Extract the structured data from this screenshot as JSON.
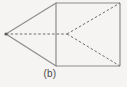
{
  "figure": {
    "caption": "(b)",
    "kind": "geometric-line-diagram",
    "background_color": "#f5f4f2",
    "solid_line_color": "#8b8b8b",
    "dashed_line_color": "#6f6f6f",
    "vertex_dot_color": "#5c5c5c"
  },
  "chart_data": {
    "type": "diagram",
    "title": "(b)",
    "xlabel": "",
    "ylabel": "",
    "coordinate_space": {
      "width": 127,
      "height": 87,
      "origin": "top-left",
      "units": "pixels"
    },
    "points": [
      {
        "id": "apex",
        "label": "left apex vertex",
        "x": 6,
        "y": 34
      },
      {
        "id": "rect_tl",
        "label": "rectangle top-left",
        "x": 56,
        "y": 3
      },
      {
        "id": "rect_tr",
        "label": "rectangle top-right",
        "x": 120,
        "y": 3
      },
      {
        "id": "rect_br",
        "label": "rectangle bottom-right",
        "x": 120,
        "y": 66
      },
      {
        "id": "rect_bl",
        "label": "rectangle bottom-left",
        "x": 56,
        "y": 66
      },
      {
        "id": "inner_node",
        "label": "interior convergence node",
        "x": 67,
        "y": 34
      }
    ],
    "segments": [
      {
        "id": "rect-top",
        "from": "rect_tl",
        "to": "rect_tr",
        "style": "solid"
      },
      {
        "id": "rect-right",
        "from": "rect_tr",
        "to": "rect_br",
        "style": "solid"
      },
      {
        "id": "rect-bottom",
        "from": "rect_br",
        "to": "rect_bl",
        "style": "solid"
      },
      {
        "id": "rect-left",
        "from": "rect_bl",
        "to": "rect_tl",
        "style": "solid"
      },
      {
        "id": "apex-to-top-left",
        "from": "apex",
        "to": "rect_tl",
        "style": "solid"
      },
      {
        "id": "apex-to-bot-left",
        "from": "apex",
        "to": "rect_bl",
        "style": "solid"
      },
      {
        "id": "apex-axis",
        "from": "apex",
        "to": "inner_node",
        "style": "dashed"
      },
      {
        "id": "node-to-top-right",
        "from": "inner_node",
        "to": "rect_tr",
        "style": "dashed"
      },
      {
        "id": "node-to-bot-right",
        "from": "inner_node",
        "to": "rect_br",
        "style": "dashed"
      }
    ],
    "annotations": [
      {
        "id": "caption",
        "text": "(b)",
        "x": 50,
        "y": 76
      }
    ],
    "legend": [],
    "grid": false
  }
}
